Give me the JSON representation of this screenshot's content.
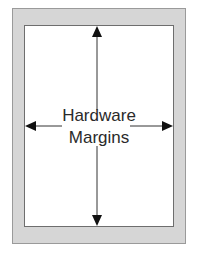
{
  "diagram": {
    "label_line1": "Hardware",
    "label_line2": "Margins",
    "colors": {
      "margin_fill": "#d6d6d6",
      "page_fill": "#ffffff",
      "arrow": "#1a1a1a"
    },
    "arrows": [
      "up",
      "down",
      "left",
      "right"
    ]
  }
}
